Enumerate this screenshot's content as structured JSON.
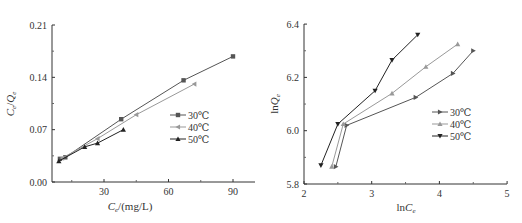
{
  "chart_data": [
    {
      "type": "line",
      "title": "",
      "xlabel": "Ce/(mg/L)",
      "ylabel": "Ce/Qe",
      "xlim": [
        5.6,
        100
      ],
      "ylim": [
        0.0,
        0.21
      ],
      "xticks": [
        "30",
        "60",
        "90"
      ],
      "yticks": [
        "0.00",
        "0.07",
        "0.14",
        "0.21"
      ],
      "grid": false,
      "legend_position": "right-middle",
      "series": [
        {
          "name": "30℃",
          "marker": "square",
          "color": "#555555",
          "x": [
            9.5,
            12,
            38,
            67,
            90
          ],
          "y": [
            0.031,
            0.033,
            0.084,
            0.136,
            0.168
          ]
        },
        {
          "name": "40℃",
          "marker": "triangle-left",
          "color": "#999999",
          "x": [
            10.5,
            27,
            45,
            72
          ],
          "y": [
            0.032,
            0.058,
            0.09,
            0.131
          ]
        },
        {
          "name": "50℃",
          "marker": "triangle-up",
          "color": "#222222",
          "x": [
            9,
            21,
            27,
            39
          ],
          "y": [
            0.028,
            0.047,
            0.052,
            0.07
          ]
        }
      ]
    },
    {
      "type": "line",
      "title": "",
      "xlabel": "lnCe",
      "ylabel": "lnQe",
      "xlim": [
        2,
        5
      ],
      "ylim": [
        5.8,
        6.4
      ],
      "xticks": [
        "2",
        "3",
        "4",
        "5"
      ],
      "yticks": [
        "5.8",
        "6.0",
        "6.2",
        "6.4"
      ],
      "grid": false,
      "legend_position": "right-middle",
      "series": [
        {
          "name": "30℃",
          "marker": "triangle-right",
          "color": "#555555",
          "x": [
            2.47,
            2.63,
            3.65,
            4.2,
            4.5
          ],
          "y": [
            5.865,
            6.02,
            6.125,
            6.215,
            6.3
          ]
        },
        {
          "name": "40℃",
          "marker": "triangle-up",
          "color": "#999999",
          "x": [
            2.41,
            2.58,
            3.3,
            3.8,
            4.27
          ],
          "y": [
            5.865,
            6.025,
            6.14,
            6.24,
            6.325
          ]
        },
        {
          "name": "50℃",
          "marker": "triangle-down",
          "color": "#222222",
          "x": [
            2.25,
            2.5,
            3.05,
            3.3,
            3.68
          ],
          "y": [
            5.87,
            6.025,
            6.15,
            6.265,
            6.36
          ]
        }
      ]
    }
  ],
  "left_chart": {
    "ylabel_main": "C",
    "ylabel_sub1": "e",
    "ylabel_slash": "/",
    "ylabel_main2": "Q",
    "ylabel_sub2": "e",
    "xlabel_main": "C",
    "xlabel_sub": "e",
    "xlabel_unit": "/(mg/L)",
    "legend": [
      "30℃",
      "40℃",
      "50℃"
    ]
  },
  "right_chart": {
    "ylabel_prefix": "ln",
    "ylabel_main": "Q",
    "ylabel_sub": "e",
    "xlabel_prefix": "ln",
    "xlabel_main": "C",
    "xlabel_sub": "e",
    "legend": [
      "30℃",
      "40℃",
      "50℃"
    ]
  }
}
